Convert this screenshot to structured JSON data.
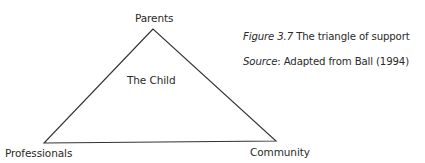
{
  "diagram": {
    "type": "triangle",
    "stroke_color": "#333333",
    "background": "#ffffff",
    "vertices": {
      "top": {
        "label": "Parents",
        "x": 153,
        "y": 29
      },
      "bottom_left": {
        "label": "Professionals",
        "x": 44,
        "y": 143
      },
      "bottom_right": {
        "label": "Community",
        "x": 276,
        "y": 141
      }
    },
    "center_label": "The Child"
  },
  "caption": {
    "figure_prefix": "Figure",
    "figure_number": "3.7",
    "title": "The triangle of support",
    "source_prefix": "Source",
    "source_text": "Adapted from Ball (1994)"
  }
}
